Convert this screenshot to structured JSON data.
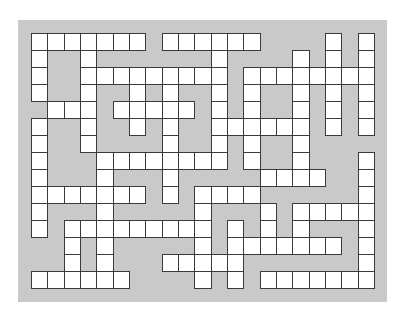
{
  "puzzle": {
    "type": "crossword",
    "cols": 21,
    "rows": 15,
    "cell_width": 16.33,
    "cell_height": 17.0,
    "colors": {
      "board": "#c9c9c9",
      "cell": "#ffffff",
      "line": "#3a3a3a"
    },
    "white_cells": [
      [
        0,
        1,
        2,
        3,
        4,
        5,
        6,
        8,
        9,
        10,
        11,
        12,
        13,
        18,
        20
      ],
      [
        0,
        3,
        11,
        16,
        18,
        20
      ],
      [
        0,
        3,
        4,
        5,
        6,
        7,
        8,
        9,
        10,
        11,
        13,
        14,
        15,
        16,
        17,
        18,
        19,
        20
      ],
      [
        0,
        3,
        6,
        8,
        11,
        13,
        16,
        18,
        20
      ],
      [
        1,
        2,
        3,
        5,
        6,
        7,
        8,
        9,
        11,
        13,
        16,
        18,
        20
      ],
      [
        0,
        3,
        6,
        8,
        11,
        12,
        13,
        14,
        15,
        16,
        18,
        20
      ],
      [
        0,
        3,
        8,
        11,
        13,
        16
      ],
      [
        0,
        4,
        5,
        6,
        7,
        8,
        9,
        10,
        11,
        13,
        16,
        20
      ],
      [
        0,
        4,
        8,
        14,
        15,
        16,
        17,
        20
      ],
      [
        0,
        1,
        2,
        3,
        4,
        5,
        6,
        8,
        10,
        11,
        12,
        13,
        20
      ],
      [
        0,
        4,
        10,
        14,
        16,
        17,
        18,
        19,
        20
      ],
      [
        0,
        2,
        3,
        4,
        5,
        6,
        7,
        8,
        9,
        10,
        12,
        14,
        16,
        20
      ],
      [
        2,
        4,
        10,
        12,
        13,
        14,
        15,
        16,
        17,
        18,
        20
      ],
      [
        2,
        4,
        8,
        9,
        10,
        11,
        12,
        20
      ],
      [
        0,
        1,
        2,
        3,
        4,
        5,
        10,
        12,
        14,
        15,
        16,
        17,
        18,
        19,
        20
      ]
    ]
  }
}
